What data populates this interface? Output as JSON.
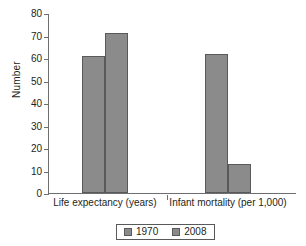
{
  "chart_data": {
    "type": "bar",
    "title": "",
    "xlabel": "",
    "ylabel": "Number",
    "ylim": [
      0,
      80
    ],
    "ytick_step": 10,
    "yticks": [
      "0",
      "10",
      "20",
      "30",
      "40",
      "50",
      "60",
      "70",
      "80"
    ],
    "grid": false,
    "legend_position": "bottom",
    "categories": [
      "Life expectancy (years)",
      "Infant mortality (per 1,000)"
    ],
    "series": [
      {
        "name": "1970",
        "values": [
          61,
          62
        ],
        "color": "#8b8b8b"
      },
      {
        "name": "2008",
        "values": [
          71,
          13
        ],
        "color": "#8b8b8b"
      }
    ]
  },
  "axis": {
    "y_title": "Number",
    "line_color": "#6d6e71"
  },
  "legend": {
    "items": [
      {
        "label": "1970"
      },
      {
        "label": "2008"
      }
    ]
  }
}
